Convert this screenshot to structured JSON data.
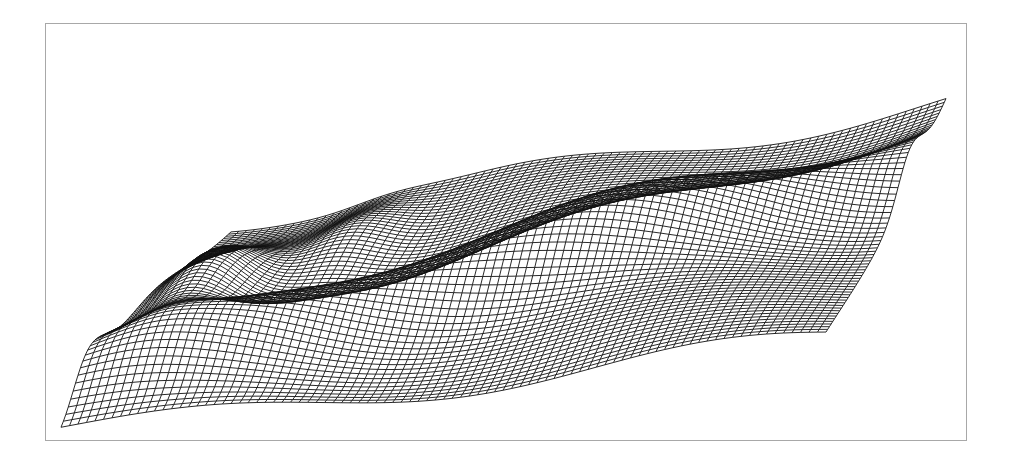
{
  "frame": {
    "border_color": "#a8a8a8",
    "background": "#ffffff"
  },
  "chart_data": {
    "type": "surface-wireframe",
    "title": "",
    "xlabel": "",
    "ylabel": "",
    "zlabel": "",
    "grid": false,
    "legend": null,
    "line_color": "#111111",
    "mesh": {
      "rows": 70,
      "cols": 90
    },
    "corners_px": {
      "near_left": [
        60,
        412
      ],
      "far_left": [
        230,
        222
      ],
      "far_right": [
        945,
        103
      ],
      "near_right": [
        825,
        336
      ]
    }
  }
}
